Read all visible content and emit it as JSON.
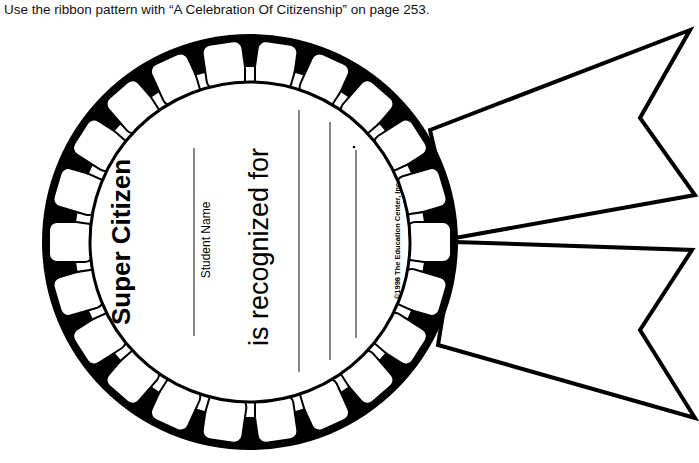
{
  "instruction": "Use the ribbon pattern with “A Celebration Of Citizenship” on page 253.",
  "award": {
    "title": "Super Citizen",
    "name_label": "Student Name",
    "recognized_text": "is recognized for",
    "copyright": "©1998 The Education Center, Inc."
  },
  "colors": {
    "ink": "#000000",
    "paper": "#ffffff"
  }
}
